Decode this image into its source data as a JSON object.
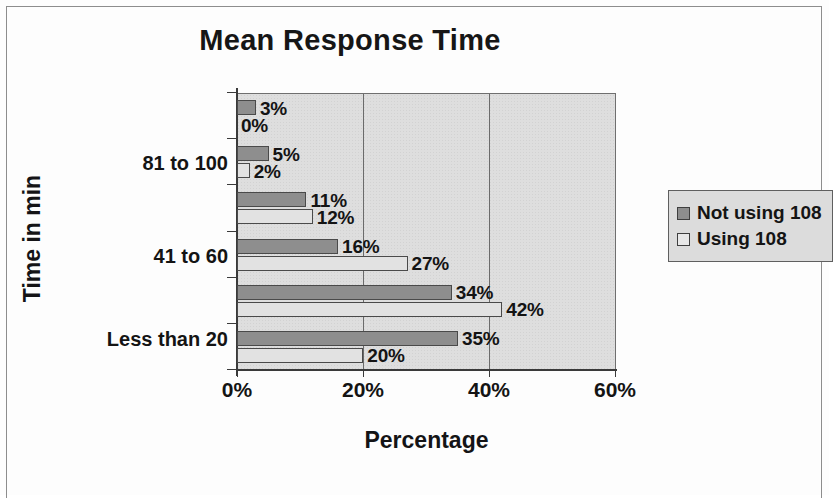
{
  "chart_data": {
    "type": "bar",
    "orientation": "horizontal",
    "title": "Mean Response Time",
    "xlabel": "Percentage",
    "ylabel": "Time in min",
    "xlim": [
      0,
      60
    ],
    "xticks": [
      "0%",
      "20%",
      "40%",
      "60%"
    ],
    "xtick_values": [
      0,
      20,
      40,
      60
    ],
    "grid": true,
    "legend_position": "right",
    "categories": [
      "",
      "81 to 100",
      "",
      "41 to 60",
      "",
      "Less than 20"
    ],
    "category_labels_visible": [
      "81 to 100",
      "41 to 60",
      "Less than 20"
    ],
    "series": [
      {
        "name": "Not using 108",
        "color": "#8e8e8e",
        "values": [
          3,
          5,
          11,
          16,
          34,
          35
        ],
        "value_labels": [
          "3%",
          "5%",
          "11%",
          "16%",
          "34%",
          "35%"
        ]
      },
      {
        "name": "Using 108",
        "color": "#e2e2e2",
        "values": [
          0,
          2,
          12,
          27,
          42,
          20
        ],
        "value_labels": [
          "0%",
          "2%",
          "12%",
          "27%",
          "42%",
          "20%"
        ]
      }
    ]
  },
  "legend": {
    "items": [
      {
        "label": "Not using 108",
        "swatch": "dark-grey-swatch"
      },
      {
        "label": "Using 108",
        "swatch": "light-grey-swatch"
      }
    ]
  },
  "colors": {
    "series_not_using": "#8e8e8e",
    "series_using": "#e2e2e2",
    "plot_background": "#dedede",
    "axis": "#3a3a3a",
    "text": "#141414"
  }
}
